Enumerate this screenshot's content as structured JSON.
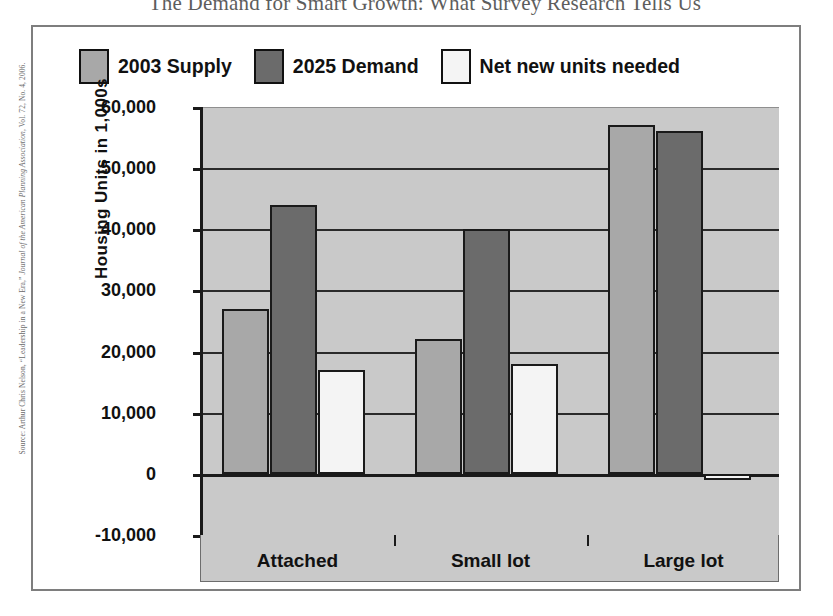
{
  "figure": {
    "title": "The Demand for Smart Growth: What Survey Research Tells Us",
    "source_prefix": "Source: Arthur Chris Nelson, “Leadership in a New Era,” ",
    "source_italic": "Journal of the American Planning Association",
    "source_suffix": ", Vol. 72, No. 4, 2006."
  },
  "colors": {
    "supply": "#a8a8a8",
    "demand": "#6b6b6b",
    "net_new": "#f4f4f4",
    "plot_background": "#c9c9c9",
    "axis": "#1a1a1a",
    "gridline": "#2a2a2a",
    "frame": "#7e7e7e"
  },
  "chart_data": {
    "type": "bar",
    "title": "The Demand for Smart Growth: What Survey Research Tells Us",
    "xlabel": "",
    "ylabel": "Housing Units  in 1,000s",
    "categories": [
      "Attached",
      "Small lot",
      "Large lot"
    ],
    "series": [
      {
        "name": "2003 Supply",
        "values": [
          27000,
          22000,
          57000
        ]
      },
      {
        "name": "2025 Demand",
        "values": [
          44000,
          40000,
          56000
        ]
      },
      {
        "name": "Net new units needed",
        "values": [
          17000,
          18000,
          -1000
        ]
      }
    ],
    "ylim": [
      -10000,
      60000
    ],
    "ytick_values": [
      60000,
      50000,
      40000,
      30000,
      20000,
      10000,
      0,
      -10000
    ],
    "ytick_labels": [
      "60,000",
      "50,000",
      "40,000",
      "30,000",
      "20,000",
      "10,000",
      "0",
      "-10,000"
    ],
    "grid": true,
    "legend_position": "top-left"
  }
}
